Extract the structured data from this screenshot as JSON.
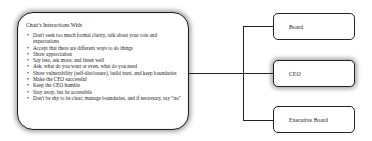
{
  "main": {
    "title": "Chair's Interactions With",
    "items": [
      "Don't seek too much formal clarity, talk about your role and expectations",
      "Accept that there are different ways to do things",
      "Show appreciation",
      "Say less, ask more, and listen well",
      "Ask: what do you want or even, what do you need",
      "Show vulnerability (self-disclosure), build trust, and keep boundaries",
      "Make the CEO successful",
      "Keep the CEO humble",
      "Stay away, but be accessible",
      "Don't be shy to be clear; manage boundaries,  and if necessary, say \"no\""
    ]
  },
  "targets": [
    {
      "label": "Board",
      "highlighted": false
    },
    {
      "label": "CEO",
      "highlighted": true
    },
    {
      "label": "Executive Board",
      "highlighted": false
    }
  ]
}
